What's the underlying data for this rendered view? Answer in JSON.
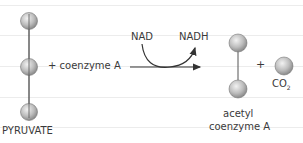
{
  "diagram": {
    "reactant_label": "PYRUVATE",
    "plus_coenzyme": "+ coenzyme A",
    "cofactor_in": "NAD",
    "cofactor_out": "NADH",
    "product1_line1": "acetyl",
    "product1_line2": "coenzyme A",
    "plus_sign": "+",
    "product2": "CO",
    "product2_sub": "2"
  },
  "colors": {
    "sphere": "#b8b8b8",
    "line": "#444444",
    "rule": "#ececec"
  }
}
